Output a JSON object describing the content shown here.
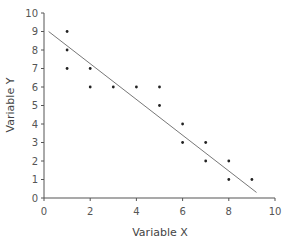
{
  "chart_data": {
    "type": "scatter",
    "title": "",
    "xlabel": "Variable X",
    "ylabel": "Variable Y",
    "xlim": [
      0,
      10
    ],
    "ylim": [
      0,
      10
    ],
    "x_ticks": [
      0,
      2,
      4,
      6,
      8,
      10
    ],
    "y_ticks": [
      0,
      1,
      2,
      3,
      4,
      5,
      6,
      7,
      8,
      9,
      10
    ],
    "grid": false,
    "legend": null,
    "series": [
      {
        "name": "observations",
        "x": [
          1,
          1,
          1,
          2,
          2,
          3,
          4,
          5,
          5,
          6,
          6,
          7,
          7,
          8,
          8,
          9
        ],
        "y": [
          9,
          8,
          7,
          7,
          6,
          6,
          6,
          6,
          5,
          4,
          3,
          3,
          2,
          2,
          1,
          1
        ],
        "marker_color": "#222222"
      }
    ],
    "trendline": {
      "type": "linear",
      "x_start": 0.2,
      "y_start": 9.0,
      "x_end": 9.2,
      "y_end": 0.3,
      "color": "#777777"
    },
    "colors": {
      "axis": "#555555",
      "text": "#555555"
    }
  }
}
